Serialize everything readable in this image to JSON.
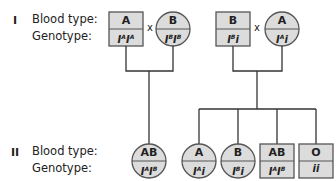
{
  "diagram": {
    "type": "pedigree",
    "row_labels": {
      "blood_type": "Blood type:",
      "genotype": "Genotype:"
    },
    "cross_symbol": "x",
    "generations": [
      {
        "label": "I",
        "couples": [
          {
            "male": {
              "shape": "square",
              "blood_type": "A",
              "genotype": [
                {
                  "base": "I",
                  "sup": "A"
                },
                {
                  "base": "I",
                  "sup": "A"
                }
              ]
            },
            "female": {
              "shape": "circle",
              "blood_type": "B",
              "genotype": [
                {
                  "base": "I",
                  "sup": "B"
                },
                {
                  "base": "I",
                  "sup": "B"
                }
              ]
            }
          },
          {
            "male": {
              "shape": "square",
              "blood_type": "B",
              "genotype": [
                {
                  "base": "I",
                  "sup": "B"
                },
                {
                  "base": "i",
                  "sup": ""
                }
              ]
            },
            "female": {
              "shape": "circle",
              "blood_type": "A",
              "genotype": [
                {
                  "base": "I",
                  "sup": "A"
                },
                {
                  "base": "i",
                  "sup": ""
                }
              ]
            }
          }
        ]
      },
      {
        "label": "II",
        "individuals": [
          {
            "shape": "circle",
            "blood_type": "AB",
            "genotype": [
              {
                "base": "I",
                "sup": "A"
              },
              {
                "base": "I",
                "sup": "B"
              }
            ],
            "parents": 0
          },
          {
            "shape": "circle",
            "blood_type": "A",
            "genotype": [
              {
                "base": "I",
                "sup": "A"
              },
              {
                "base": "i",
                "sup": ""
              }
            ],
            "parents": 1
          },
          {
            "shape": "circle",
            "blood_type": "B",
            "genotype": [
              {
                "base": "I",
                "sup": "B"
              },
              {
                "base": "i",
                "sup": ""
              }
            ],
            "parents": 1
          },
          {
            "shape": "square",
            "blood_type": "AB",
            "genotype": [
              {
                "base": "I",
                "sup": "A"
              },
              {
                "base": "I",
                "sup": "B"
              }
            ],
            "parents": 1
          },
          {
            "shape": "square",
            "blood_type": "O",
            "genotype": [
              {
                "base": "i",
                "sup": ""
              },
              {
                "base": "i",
                "sup": ""
              }
            ],
            "parents": 1
          }
        ]
      }
    ],
    "colors": {
      "fill": "#dcdcdc",
      "stroke": "#555555",
      "text": "#222222"
    }
  }
}
